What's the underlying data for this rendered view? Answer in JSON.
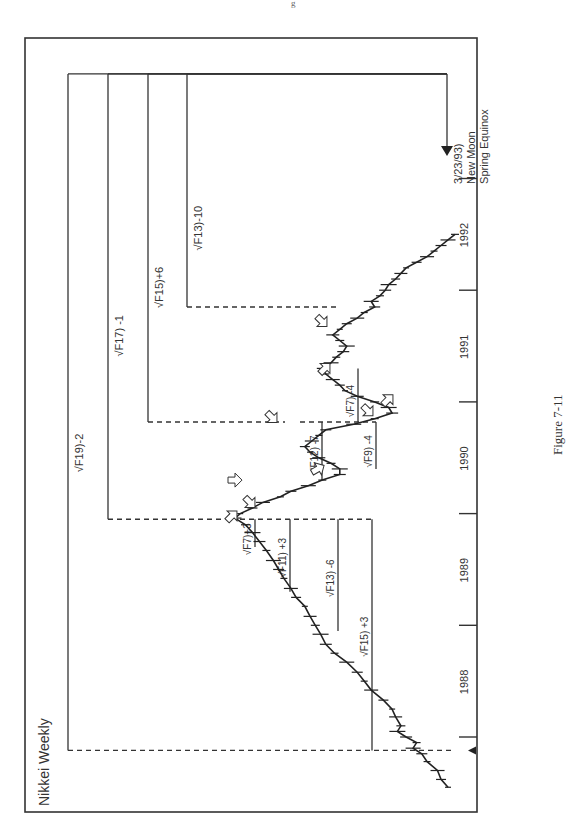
{
  "page": {
    "page_number_fragment": "g",
    "figure_caption": "Figure 7-11"
  },
  "chart_data": {
    "type": "line",
    "title": "Nikkei Weekly",
    "orientation": "rotated-90-ccw (time axis vertical on right, price increases leftward)",
    "xlabel": "",
    "ylabel": "",
    "x_axis": {
      "ticks": [
        1987.75,
        1988,
        1989,
        1990,
        1991,
        1992,
        1993
      ],
      "tick_labels": [
        "1988",
        "1989",
        "1990",
        "1991",
        "1992"
      ],
      "tick_label_positions": [
        1988.5,
        1989.5,
        1990.5,
        1991.5,
        1992.5
      ],
      "range": [
        1987.35,
        1993.35
      ]
    },
    "y_axis": {
      "range_relative": [
        0,
        1
      ],
      "note": "price scale not labeled"
    },
    "grid": false,
    "legend": "none",
    "series": [
      {
        "name": "Nikkei Weekly (relative price level)",
        "x": [
          1987.55,
          1987.62,
          1987.7,
          1987.78,
          1987.85,
          1987.9,
          1987.95,
          1988.0,
          1988.05,
          1988.1,
          1988.18,
          1988.25,
          1988.33,
          1988.42,
          1988.5,
          1988.58,
          1988.67,
          1988.75,
          1988.83,
          1988.92,
          1989.0,
          1989.08,
          1989.17,
          1989.25,
          1989.33,
          1989.42,
          1989.5,
          1989.58,
          1989.67,
          1989.75,
          1989.83,
          1989.9,
          1989.96,
          1990.0,
          1990.05,
          1990.1,
          1990.15,
          1990.2,
          1990.25,
          1990.3,
          1990.35,
          1990.4,
          1990.45,
          1990.5,
          1990.55,
          1990.6,
          1990.65,
          1990.7,
          1990.75,
          1990.8,
          1990.85,
          1990.9,
          1990.95,
          1991.0,
          1991.05,
          1991.1,
          1991.15,
          1991.2,
          1991.25,
          1991.3,
          1991.35,
          1991.4,
          1991.45,
          1991.5,
          1991.55,
          1991.6,
          1991.65,
          1991.7,
          1991.75,
          1991.8,
          1991.85,
          1991.9,
          1991.95,
          1992.0,
          1992.05,
          1992.1,
          1992.15,
          1992.2,
          1992.25,
          1992.3,
          1992.35,
          1992.4,
          1992.45,
          1992.5
        ],
        "y": [
          0.68,
          0.72,
          0.74,
          0.8,
          0.83,
          0.88,
          0.86,
          0.92,
          0.97,
          0.95,
          0.98,
          1.0,
          1.05,
          1.12,
          1.16,
          1.2,
          1.26,
          1.33,
          1.38,
          1.41,
          1.44,
          1.47,
          1.5,
          1.55,
          1.58,
          1.62,
          1.65,
          1.68,
          1.72,
          1.76,
          1.8,
          1.84,
          1.9,
          1.87,
          1.8,
          1.74,
          1.64,
          1.58,
          1.48,
          1.4,
          1.3,
          1.3,
          1.35,
          1.42,
          1.47,
          1.5,
          1.46,
          1.42,
          1.38,
          1.22,
          1.1,
          1.0,
          1.02,
          1.1,
          1.2,
          1.27,
          1.3,
          1.34,
          1.38,
          1.4,
          1.35,
          1.32,
          1.28,
          1.26,
          1.3,
          1.34,
          1.3,
          1.26,
          1.2,
          1.16,
          1.1,
          1.12,
          1.07,
          1.04,
          1.02,
          0.98,
          0.95,
          0.92,
          0.86,
          0.8,
          0.76,
          0.72,
          0.68,
          0.64
        ]
      }
    ],
    "annotations": {
      "cycle_lines": [
        {
          "label": "√F19)-2",
          "from": 1987.88,
          "to": 1993.22,
          "level": "outer"
        },
        {
          "label": "√F17) -1",
          "from": 1989.95,
          "to": 1993.22,
          "level": 2
        },
        {
          "label": "√F15)+6",
          "from": 1990.82,
          "to": 1993.22,
          "level": 3
        },
        {
          "label": "√F13)-10",
          "from": 1991.85,
          "to": 1993.22,
          "level": 4
        },
        {
          "label": "√F15) +3",
          "from": 1987.88,
          "to": 1989.95,
          "side": "right"
        },
        {
          "label": "√F13) -6",
          "from": 1988.95,
          "to": 1989.95
        },
        {
          "label": "√F11) +3",
          "from": 1989.3,
          "to": 1989.95
        },
        {
          "label": "√F7)+3",
          "from": 1989.7,
          "to": 1989.95
        },
        {
          "label": "√F12) -7",
          "from": 1990.3,
          "to": 1990.82
        },
        {
          "label": "√F7) -4",
          "from": 1990.82,
          "to": 1991.3
        },
        {
          "label": "√F9) -4",
          "from": 1990.4,
          "to": 1990.82
        }
      ],
      "target_date_label": [
        "3/23/93)",
        "New Moon",
        "Spring Equinox"
      ],
      "target_date": 1993.22,
      "hollow_arrows_at": [
        1989.95,
        1990.3,
        1990.1,
        1990.78,
        1990.87,
        1991.3,
        1991.7,
        1990.45
      ]
    }
  }
}
